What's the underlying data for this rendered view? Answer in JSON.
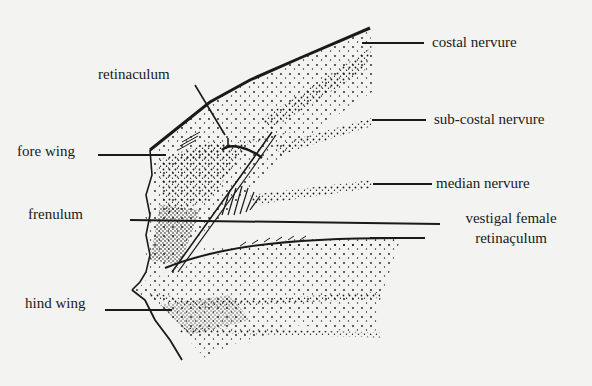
{
  "figure": {
    "background": "#f3f3f1",
    "ink": "#1a1a1a"
  },
  "labels": {
    "costal_nervure": "costal nervure",
    "sub_costal_nervure": "sub-costal nervure",
    "median_nervure": "median nervure",
    "vestigal_female_line1": "vestigal female",
    "vestigal_female_line2": "retinaçulum",
    "retinaculum": "retinaculum",
    "fore_wing": "fore wing",
    "frenulum": "frenulum",
    "hind_wing": "hind wing"
  }
}
